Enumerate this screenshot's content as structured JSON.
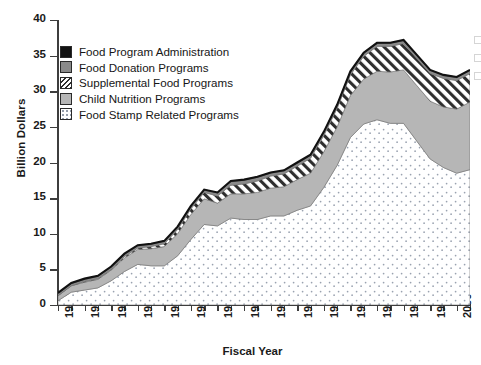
{
  "chart_data": {
    "type": "area",
    "title": "",
    "xlabel": "Fiscal Year",
    "ylabel": "Billion Dollars",
    "ylim": [
      0,
      40
    ],
    "yticks": [
      0,
      5,
      10,
      15,
      20,
      25,
      30,
      35,
      40
    ],
    "xlim": [
      1970,
      2001
    ],
    "xtick_labels": [
      "1970",
      "1972",
      "1974",
      "1976",
      "1978",
      "1980",
      "1982",
      "1984",
      "1986",
      "1988",
      "1990",
      "1992",
      "1994",
      "1996",
      "1998",
      "2000"
    ],
    "grid": false,
    "legend_position": "upper-left",
    "stacked": true,
    "stack_order_bottom_to_top": [
      "Food Stamp Related Programs",
      "Child Nutrition Programs",
      "Supplemental Food Programs",
      "Food Donation Programs",
      "Food Program Administration"
    ],
    "x": [
      1970,
      1971,
      1972,
      1973,
      1974,
      1975,
      1976,
      1977,
      1978,
      1979,
      1980,
      1981,
      1982,
      1983,
      1984,
      1985,
      1986,
      1987,
      1988,
      1989,
      1990,
      1991,
      1992,
      1993,
      1994,
      1995,
      1996,
      1997,
      1998,
      1999,
      2000,
      2001
    ],
    "series": [
      {
        "name": "Food Stamp Related Programs",
        "color": "#ffffff",
        "pattern": "dots",
        "values": [
          0.6,
          1.8,
          2.1,
          2.4,
          3.4,
          4.7,
          5.7,
          5.5,
          5.5,
          6.9,
          9.2,
          11.3,
          11.1,
          12.2,
          12.0,
          12.0,
          12.5,
          12.5,
          13.3,
          13.9,
          16.5,
          19.6,
          23.5,
          25.4,
          26.0,
          25.5,
          25.5,
          23.0,
          20.5,
          19.3,
          18.5,
          19.0
        ]
      },
      {
        "name": "Child Nutrition Programs",
        "color": "#b6b6b6",
        "pattern": "solid",
        "values": [
          0.7,
          0.9,
          1.1,
          1.2,
          1.5,
          1.9,
          2.1,
          2.4,
          2.7,
          3.1,
          3.5,
          3.6,
          3.2,
          3.4,
          3.6,
          3.8,
          3.9,
          4.1,
          4.3,
          4.6,
          5.0,
          5.4,
          5.9,
          6.3,
          6.8,
          7.2,
          7.5,
          7.8,
          8.1,
          8.5,
          9.0,
          9.5
        ]
      },
      {
        "name": "Supplemental Food Programs",
        "color": "#ffffff",
        "pattern": "diagonal-hatch",
        "values": [
          0.0,
          0.0,
          0.1,
          0.1,
          0.1,
          0.2,
          0.2,
          0.3,
          0.4,
          0.6,
          0.8,
          0.9,
          1.0,
          1.2,
          1.4,
          1.6,
          1.7,
          1.8,
          1.9,
          2.1,
          2.3,
          2.6,
          2.9,
          3.2,
          3.5,
          3.6,
          3.7,
          3.8,
          3.9,
          4.0,
          4.0,
          4.0
        ]
      },
      {
        "name": "Food Donation Programs",
        "color": "#8a8a8a",
        "pattern": "solid",
        "values": [
          0.3,
          0.3,
          0.3,
          0.3,
          0.3,
          0.3,
          0.3,
          0.3,
          0.3,
          0.3,
          0.3,
          0.3,
          0.4,
          0.5,
          0.5,
          0.5,
          0.4,
          0.4,
          0.4,
          0.4,
          0.4,
          0.4,
          0.4,
          0.4,
          0.4,
          0.4,
          0.4,
          0.4,
          0.4,
          0.4,
          0.4,
          0.4
        ]
      },
      {
        "name": "Food Program Administration",
        "color": "#121212",
        "pattern": "solid",
        "values": [
          0.1,
          0.1,
          0.1,
          0.1,
          0.1,
          0.1,
          0.1,
          0.1,
          0.1,
          0.1,
          0.1,
          0.1,
          0.1,
          0.1,
          0.1,
          0.1,
          0.1,
          0.1,
          0.1,
          0.1,
          0.1,
          0.1,
          0.1,
          0.1,
          0.1,
          0.1,
          0.1,
          0.1,
          0.1,
          0.1,
          0.1,
          0.1
        ]
      }
    ],
    "totals": [
      1.7,
      3.1,
      3.7,
      4.1,
      5.4,
      7.2,
      8.4,
      8.6,
      9.0,
      11.0,
      13.9,
      16.2,
      15.8,
      17.4,
      17.6,
      18.0,
      18.6,
      18.9,
      20.0,
      21.1,
      24.3,
      28.1,
      32.8,
      35.4,
      36.8,
      36.8,
      37.2,
      35.1,
      33.0,
      32.3,
      32.0,
      33.0
    ]
  },
  "legend": {
    "items": [
      {
        "label": "Food Program Administration",
        "swatch": "black"
      },
      {
        "label": "Food Donation Programs",
        "swatch": "dark-gray"
      },
      {
        "label": "Supplemental Food Programs",
        "swatch": "hatch"
      },
      {
        "label": "Child Nutrition Programs",
        "swatch": "light-gray"
      },
      {
        "label": "Food Stamp Related Programs",
        "swatch": "dots"
      }
    ]
  }
}
